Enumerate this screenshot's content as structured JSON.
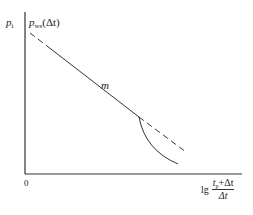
{
  "diagram": {
    "y_axis_label": "p",
    "y_axis_label_sub": "i",
    "curve_label": "p",
    "curve_label_sub": "ws",
    "curve_label_arg": "(Δt)",
    "slope_label": "m",
    "origin_label": "0",
    "x_axis_label_prefix": "lg",
    "x_axis_fraction_numerator_t": "t",
    "x_axis_fraction_numerator_sub": "p",
    "x_axis_fraction_numerator_rest": "+Δt",
    "x_axis_fraction_denominator": "Δt"
  }
}
